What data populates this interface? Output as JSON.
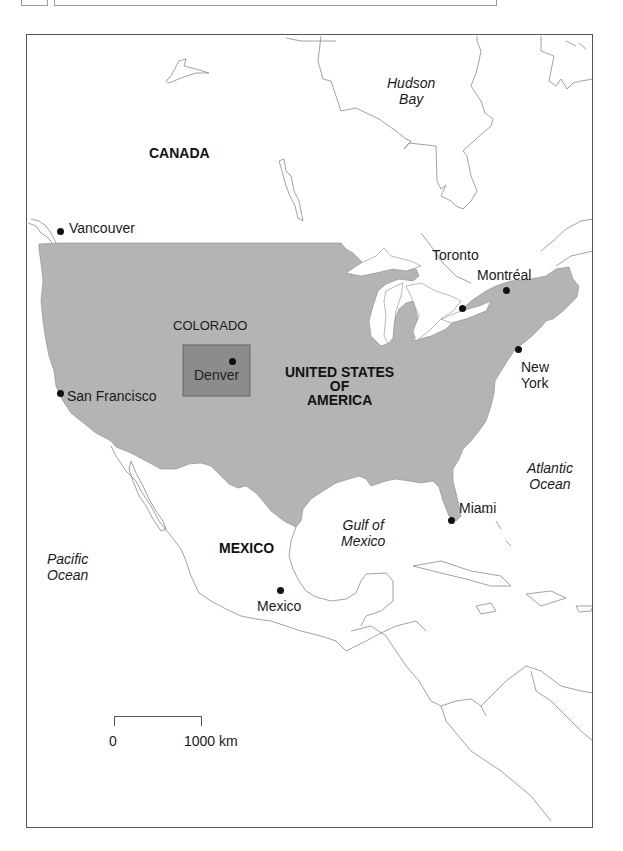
{
  "map": {
    "colors": {
      "usa_fill": "#b4b4b4",
      "colorado_fill": "#8c8c8c",
      "border_line": "#8a8a8a",
      "frame": "#555555",
      "text": "#1a1a1a"
    },
    "countries": [
      {
        "name": "CANADA"
      },
      {
        "name": "UNITED STATES OF AMERICA",
        "lines": [
          "UNITED STATES",
          "OF",
          "AMERICA"
        ]
      },
      {
        "name": "MEXICO"
      }
    ],
    "regions": [
      {
        "name": "COLORADO",
        "highlighted": true
      }
    ],
    "water_bodies": [
      {
        "name": "Hudson Bay",
        "lines": [
          "Hudson",
          "Bay"
        ]
      },
      {
        "name": "Pacific Ocean",
        "lines": [
          "Pacific",
          "Ocean"
        ]
      },
      {
        "name": "Atlantic Ocean",
        "lines": [
          "Atlantic",
          "Ocean"
        ]
      },
      {
        "name": "Gulf of Mexico",
        "lines": [
          "Gulf of",
          "Mexico"
        ]
      }
    ],
    "cities": [
      {
        "name": "Vancouver"
      },
      {
        "name": "Toronto"
      },
      {
        "name": "Montréal"
      },
      {
        "name": "New York",
        "lines": [
          "New",
          "York"
        ]
      },
      {
        "name": "San Francisco"
      },
      {
        "name": "Denver"
      },
      {
        "name": "Miami"
      },
      {
        "name": "Mexico"
      }
    ],
    "scale": {
      "start_label": "0",
      "end_label": "1000 km"
    }
  }
}
